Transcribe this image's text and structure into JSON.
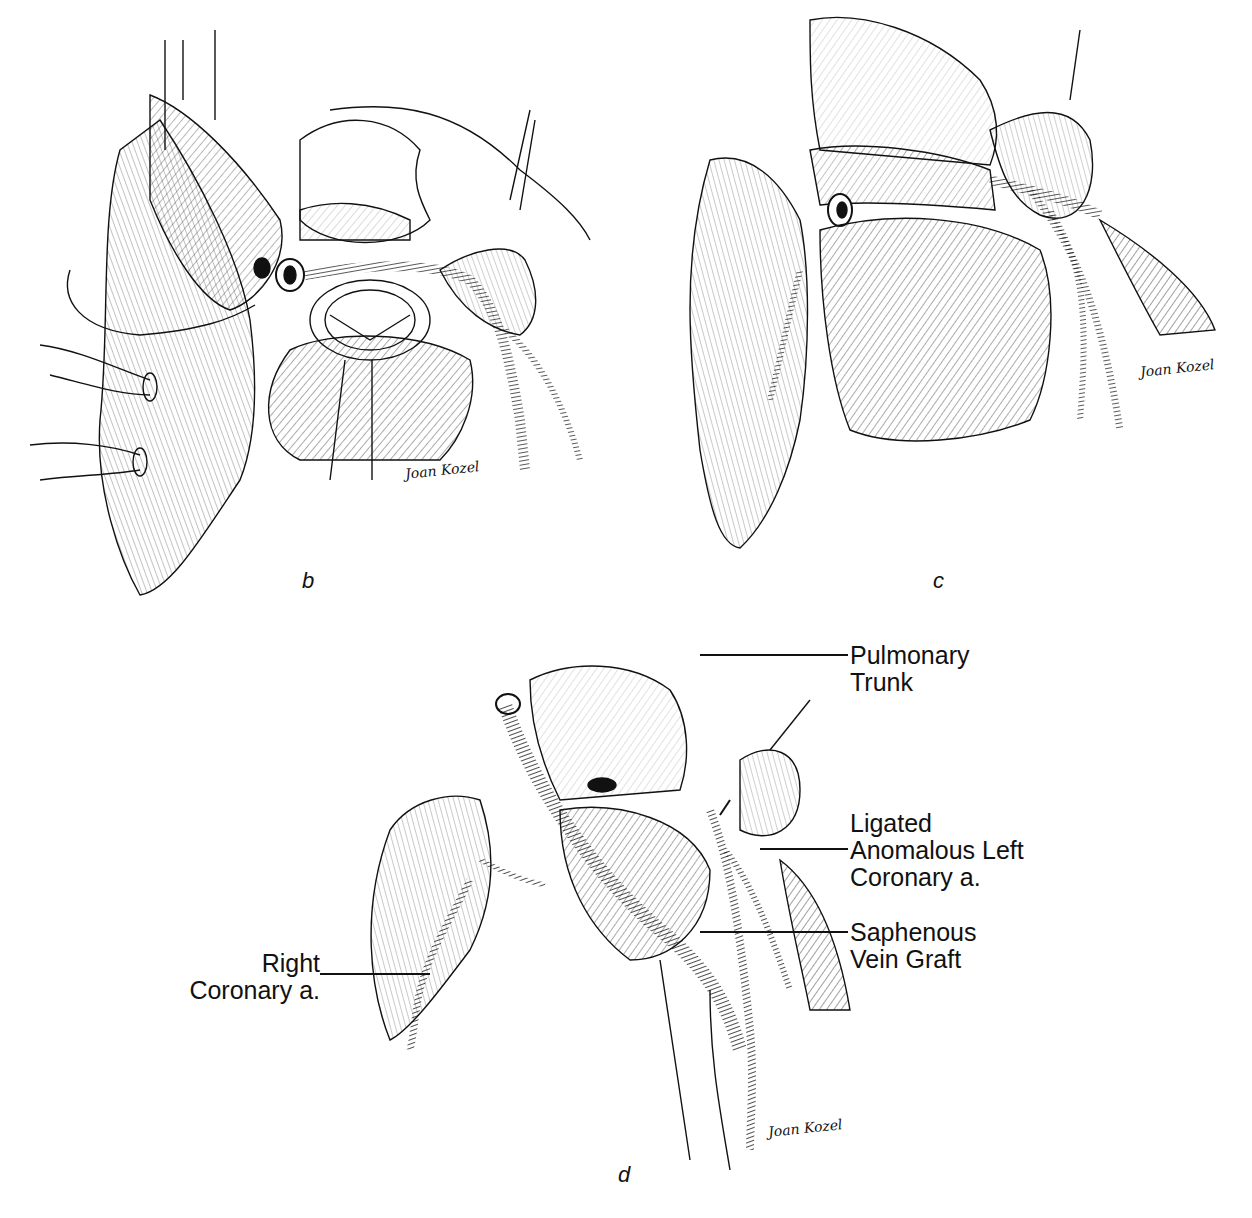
{
  "figure": {
    "panels": [
      {
        "id": "b",
        "label": "b",
        "signature": "Joan Kozel"
      },
      {
        "id": "c",
        "label": "c",
        "signature": "Joan Kozel"
      },
      {
        "id": "d",
        "label": "d",
        "signature": "Joan Kozel"
      }
    ],
    "callouts": {
      "pulmonary_trunk": [
        "Pulmonary",
        "Trunk"
      ],
      "ligated_left_coronary": [
        "Ligated",
        "Anomalous Left",
        "Coronary a."
      ],
      "saphenous_vein_graft": [
        "Saphenous",
        "Vein Graft"
      ],
      "right_coronary": [
        "Right",
        "Coronary a."
      ]
    },
    "colors": {
      "ink": "#111111",
      "paper": "#ffffff"
    }
  }
}
